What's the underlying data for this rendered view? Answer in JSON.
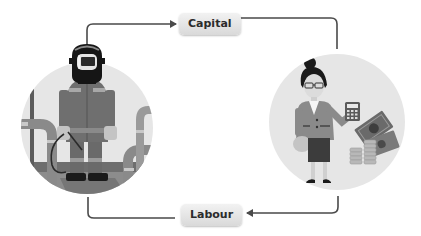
{
  "diagram": {
    "type": "cycle-flow",
    "nodes": [
      {
        "id": "capital",
        "label": "Capital"
      },
      {
        "id": "labour",
        "label": "Labour"
      }
    ],
    "illustrations": [
      {
        "id": "worker",
        "description": "welder in protective mask standing among industrial pipes"
      },
      {
        "id": "capitalist",
        "description": "businesswoman with calculator, banknotes and coin stacks"
      }
    ],
    "edges": [
      {
        "from": "worker",
        "to": "capital"
      },
      {
        "from": "capital",
        "to": "capitalist"
      },
      {
        "from": "capitalist",
        "to": "labour"
      },
      {
        "from": "labour",
        "to": "worker"
      }
    ]
  },
  "colors": {
    "line": "#4a4a4a",
    "circle_bg": "#e6e6e6",
    "label_bg": "#e2e2e2",
    "label_text": "#2b2b2b"
  }
}
